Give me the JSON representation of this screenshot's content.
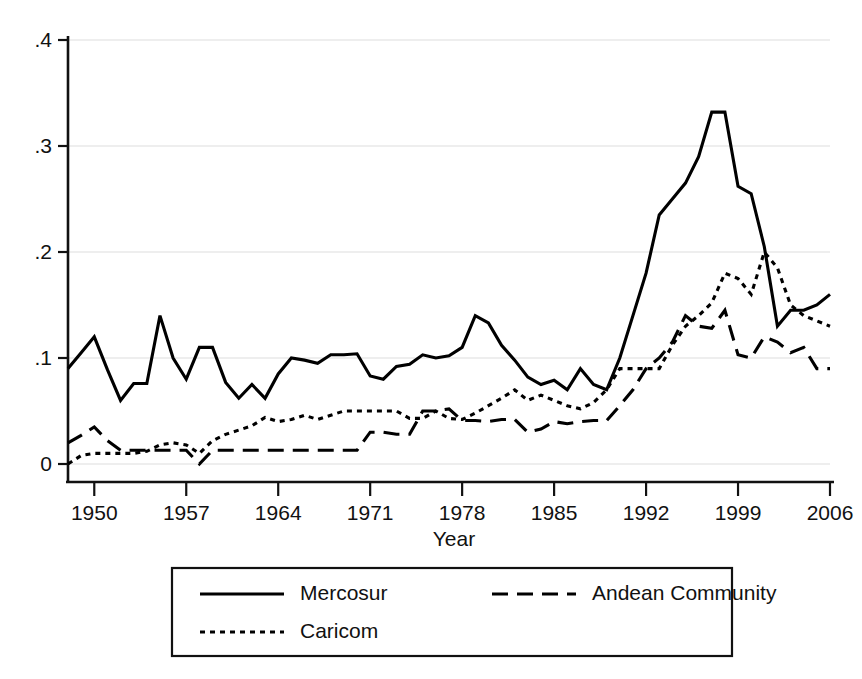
{
  "chart_data": {
    "type": "line",
    "title": "",
    "xlabel": "Year",
    "ylabel": "",
    "xlim": [
      1948,
      2006
    ],
    "ylim": [
      0,
      0.4
    ],
    "grid": true,
    "legend_position": "bottom",
    "xticks": [
      "1950",
      "1957",
      "1964",
      "1971",
      "1978",
      "1985",
      "1992",
      "1999",
      "2006"
    ],
    "xtick_values": [
      1950,
      1957,
      1964,
      1971,
      1978,
      1985,
      1992,
      1999,
      2006
    ],
    "yticks": [
      "0",
      ".1",
      ".2",
      ".3",
      ".4"
    ],
    "ytick_values": [
      0,
      0.1,
      0.2,
      0.3,
      0.4
    ],
    "x": [
      1948,
      1949,
      1950,
      1951,
      1952,
      1953,
      1954,
      1955,
      1956,
      1957,
      1958,
      1959,
      1960,
      1961,
      1962,
      1963,
      1964,
      1965,
      1966,
      1967,
      1968,
      1969,
      1970,
      1971,
      1972,
      1973,
      1974,
      1975,
      1976,
      1977,
      1978,
      1979,
      1980,
      1981,
      1982,
      1983,
      1984,
      1985,
      1986,
      1987,
      1988,
      1989,
      1990,
      1991,
      1992,
      1993,
      1994,
      1995,
      1996,
      1997,
      1998,
      1999,
      2000,
      2001,
      2002,
      2003,
      2004,
      2005,
      2006
    ],
    "series": [
      {
        "name": "Mercosur",
        "style": "solid",
        "values": [
          0.09,
          0.105,
          0.12,
          0.089,
          0.06,
          0.076,
          0.076,
          0.14,
          0.1,
          0.08,
          0.11,
          0.11,
          0.077,
          0.062,
          0.075,
          0.062,
          0.085,
          0.1,
          0.098,
          0.095,
          0.103,
          0.103,
          0.104,
          0.083,
          0.08,
          0.092,
          0.094,
          0.103,
          0.1,
          0.102,
          0.11,
          0.14,
          0.133,
          0.112,
          0.098,
          0.082,
          0.075,
          0.079,
          0.07,
          0.09,
          0.075,
          0.07,
          0.1,
          0.14,
          0.18,
          0.235,
          0.25,
          0.265,
          0.29,
          0.332,
          0.332,
          0.262,
          0.255,
          0.205,
          0.13,
          0.145,
          0.145,
          0.15,
          0.16
        ]
      },
      {
        "name": "Andean Community",
        "style": "dashed",
        "values": [
          0.02,
          0.027,
          0.035,
          0.022,
          0.013,
          0.013,
          0.013,
          0.013,
          0.013,
          0.013,
          0.0,
          0.013,
          0.013,
          0.013,
          0.013,
          0.013,
          0.013,
          0.013,
          0.013,
          0.013,
          0.013,
          0.013,
          0.013,
          0.03,
          0.03,
          0.028,
          0.028,
          0.05,
          0.05,
          0.052,
          0.041,
          0.041,
          0.04,
          0.042,
          0.042,
          0.03,
          0.033,
          0.04,
          0.038,
          0.04,
          0.041,
          0.041,
          0.055,
          0.07,
          0.09,
          0.1,
          0.115,
          0.14,
          0.13,
          0.128,
          0.145,
          0.103,
          0.1,
          0.12,
          0.115,
          0.105,
          0.11,
          0.09,
          0.09
        ]
      },
      {
        "name": "Caricom",
        "style": "dotted",
        "values": [
          0.0,
          0.008,
          0.01,
          0.01,
          0.01,
          0.01,
          0.012,
          0.018,
          0.02,
          0.018,
          0.01,
          0.022,
          0.028,
          0.032,
          0.036,
          0.044,
          0.04,
          0.042,
          0.046,
          0.042,
          0.046,
          0.05,
          0.05,
          0.05,
          0.05,
          0.05,
          0.043,
          0.043,
          0.05,
          0.043,
          0.042,
          0.048,
          0.055,
          0.062,
          0.07,
          0.06,
          0.065,
          0.06,
          0.055,
          0.052,
          0.058,
          0.07,
          0.09,
          0.09,
          0.09,
          0.09,
          0.112,
          0.13,
          0.14,
          0.152,
          0.18,
          0.175,
          0.16,
          0.2,
          0.185,
          0.15,
          0.14,
          0.135,
          0.13
        ]
      }
    ]
  },
  "legend": {
    "items": [
      {
        "label": "Mercosur",
        "style": "solid"
      },
      {
        "label": "Andean Community",
        "style": "dashed"
      },
      {
        "label": "Caricom",
        "style": "dotted"
      }
    ]
  },
  "axis": {
    "x_title": "Year"
  }
}
